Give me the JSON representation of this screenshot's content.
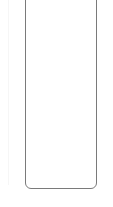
{
  "frame": {
    "border_color": "#7a7a7a",
    "background": "#ffffff"
  },
  "screen": {
    "content": ""
  }
}
